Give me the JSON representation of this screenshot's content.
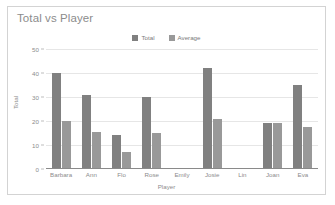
{
  "chart_data": {
    "type": "bar",
    "title": "Total vs Player",
    "xlabel": "Player",
    "ylabel": "Total",
    "categories": [
      "Barbara",
      "Ann",
      "Flo",
      "Rose",
      "Emily",
      "Josie",
      "Lin",
      "Joan",
      "Eva"
    ],
    "series": [
      {
        "name": "Total",
        "color": "#808080",
        "values": [
          40,
          31,
          14,
          30,
          0,
          42,
          0,
          19,
          35
        ]
      },
      {
        "name": "Average",
        "color": "#999999",
        "values": [
          20,
          15.5,
          7,
          15,
          0,
          21,
          0,
          19,
          17.5
        ]
      }
    ],
    "ylim": [
      0,
      50
    ],
    "ytick_labels": [
      "50",
      "40",
      "30",
      "20",
      "10",
      "0"
    ],
    "ytick_values": [
      50,
      40,
      30,
      20,
      10,
      0
    ],
    "grid": true,
    "legend_position": "top-center",
    "background_color": "#ffffff",
    "border_color": "#d3d3d3",
    "gridline_color": "#e6e6e6",
    "axis_color": "#8a8a8a",
    "text_color": "#8c8c8c"
  }
}
